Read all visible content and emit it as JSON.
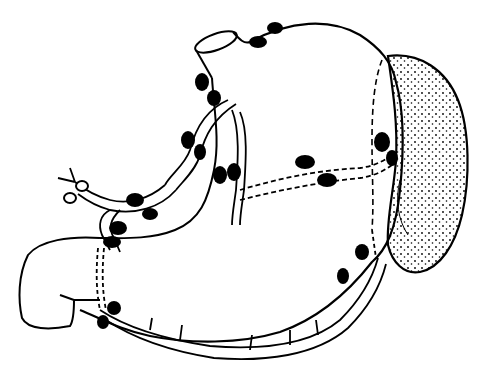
{
  "figure": {
    "background": "#ffffff",
    "ink": "#000000",
    "labels": []
  },
  "structures": {
    "organs": [
      "stomach",
      "esophagus-stump",
      "duodenum",
      "spleen"
    ],
    "vessels": [
      "celiac-trunk",
      "left-gastric-artery",
      "common-hepatic-artery",
      "splenic-artery",
      "right-gastroepiploic-artery",
      "left-gastroepiploic-artery"
    ],
    "lymph_node_count": 20
  }
}
